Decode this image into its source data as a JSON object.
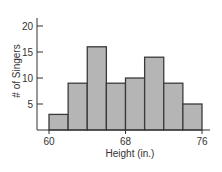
{
  "chart_data": {
    "type": "bar",
    "subtype": "histogram",
    "title": "",
    "xlabel": "Height (in.)",
    "ylabel": "# of Singers",
    "bin_edges": [
      60,
      62,
      64,
      66,
      68,
      70,
      72,
      74,
      76
    ],
    "categories": [
      "60-62",
      "62-64",
      "64-66",
      "66-68",
      "68-70",
      "70-72",
      "72-74",
      "74-76"
    ],
    "values": [
      3,
      9,
      16,
      9,
      10,
      14,
      9,
      5
    ],
    "xlim": [
      60,
      76
    ],
    "ylim": [
      0,
      20
    ],
    "x_ticks": [
      60,
      68,
      76
    ],
    "y_ticks": [
      5,
      10,
      15,
      20
    ],
    "grid": false,
    "legend": null,
    "colors": {
      "bar_fill": "#b5b5b5",
      "bar_edge": "#3a3a3a",
      "axis": "#333333",
      "text": "#333333"
    }
  }
}
